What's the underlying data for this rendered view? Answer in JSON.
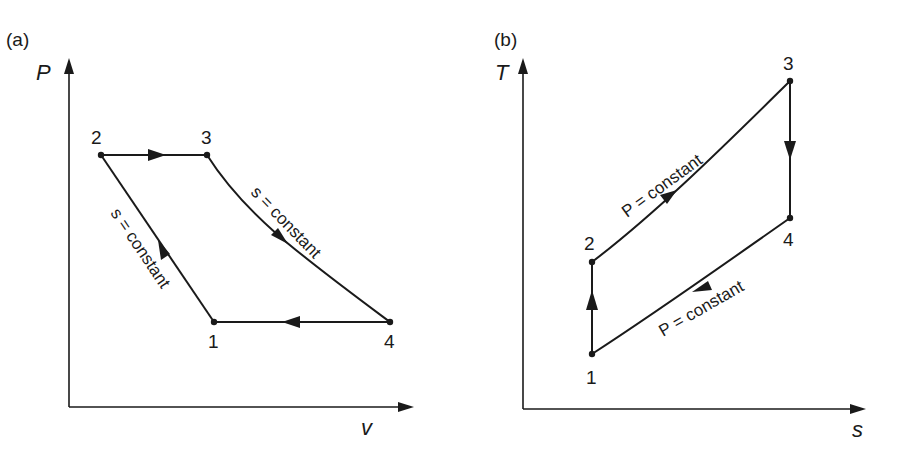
{
  "figure": {
    "panels": [
      {
        "id": "a",
        "label": "(a)",
        "x_axis": "v",
        "y_axis": "P",
        "points": [
          {
            "id": "1",
            "label": "1"
          },
          {
            "id": "2",
            "label": "2"
          },
          {
            "id": "3",
            "label": "3"
          },
          {
            "id": "4",
            "label": "4"
          }
        ],
        "annotations": {
          "process_1_2": "s = constant",
          "process_3_4": "s = constant"
        }
      },
      {
        "id": "b",
        "label": "(b)",
        "x_axis": "s",
        "y_axis": "T",
        "points": [
          {
            "id": "1",
            "label": "1"
          },
          {
            "id": "2",
            "label": "2"
          },
          {
            "id": "3",
            "label": "3"
          },
          {
            "id": "4",
            "label": "4"
          }
        ],
        "annotations": {
          "process_2_3": "P = constant",
          "process_4_1": "P = constant"
        }
      }
    ]
  },
  "colors": {
    "ink": "#1a1a1a",
    "background": "#ffffff"
  }
}
